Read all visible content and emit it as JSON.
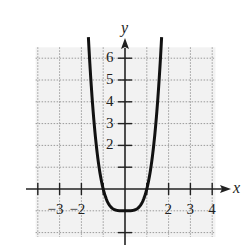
{
  "chart_data": {
    "type": "line",
    "title": "",
    "xlabel": "x",
    "ylabel": "y",
    "function": "y = x^4 - 1",
    "xlim": [
      -4,
      4.5
    ],
    "ylim": [
      -2,
      6.5
    ],
    "grid": true,
    "x_ticks": [
      -4,
      -3,
      -2,
      -1,
      1,
      2,
      3,
      4
    ],
    "x_tick_labels": [
      "-3",
      "-2",
      "2",
      "3",
      "4"
    ],
    "x_tick_label_values": [
      -3,
      -2,
      2,
      3,
      4
    ],
    "y_ticks": [
      -2,
      -1,
      1,
      2,
      3,
      4,
      5,
      6
    ],
    "y_tick_labels": [
      "2",
      "3",
      "4",
      "5",
      "6"
    ],
    "y_tick_label_values": [
      2,
      3,
      4,
      5,
      6
    ],
    "series": [
      {
        "name": "curve",
        "x": [
          -1.65,
          -1.5,
          -1.25,
          -1.0,
          -0.75,
          -0.5,
          -0.25,
          0,
          0.25,
          0.5,
          0.75,
          1.0,
          1.25,
          1.5,
          1.65
        ],
        "y": [
          6.41,
          4.06,
          1.44,
          0,
          -0.68,
          -0.94,
          -1.0,
          -1.0,
          -1.0,
          -0.94,
          -0.68,
          0,
          1.44,
          4.06,
          6.41
        ]
      }
    ],
    "minimum": {
      "x": 0,
      "y": -1
    },
    "x_intercepts": [
      -1,
      1
    ]
  },
  "labels": {
    "x_axis": "x",
    "y_axis": "y"
  },
  "colors": {
    "curve": "#111111",
    "axis": "#222222",
    "grid": "#9a9a9a",
    "plot_bg": "#f2f2f2"
  }
}
